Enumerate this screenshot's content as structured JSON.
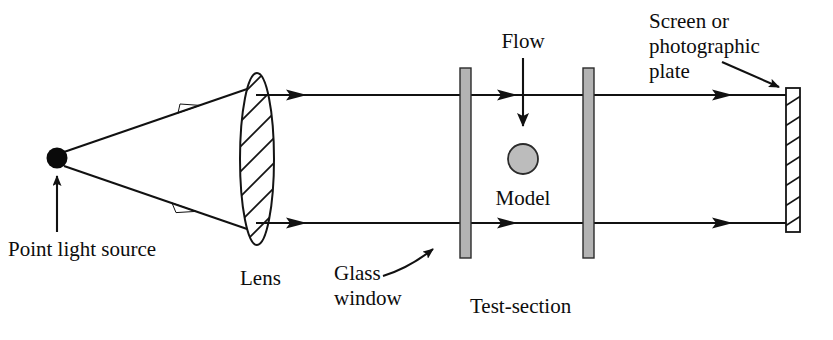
{
  "figure": {
    "background_color": "#ffffff",
    "ink_color": "#111111",
    "width": 833,
    "height": 340
  },
  "labels": {
    "point_light_source": "Point light source",
    "lens": "Lens",
    "glass_window_line1": "Glass",
    "glass_window_line2": "window",
    "test_section": "Test-section",
    "flow": "Flow",
    "model": "Model",
    "screen_line1": "Screen or",
    "screen_line2": "photographic",
    "screen_line3": "plate"
  },
  "components": {
    "point_source": {
      "name": "point-light-source",
      "shape": "filled-circle",
      "cx": 57,
      "cy": 158,
      "r": 10,
      "color": "#0a0a0a"
    },
    "lens": {
      "name": "lens",
      "shape": "hatched-ellipse",
      "cx": 257,
      "cy": 159,
      "rx": 17,
      "ry": 86,
      "hatch_direction": "diagonal-up-right",
      "hatch_count": 9,
      "fill": "#ffffff",
      "stroke": "#141414"
    },
    "glass_window_left": {
      "name": "glass-window-left",
      "shape": "rect",
      "x": 460,
      "y": 68,
      "width": 11,
      "height": 190,
      "fill": "#b3b3b3"
    },
    "glass_window_right": {
      "name": "glass-window-right",
      "shape": "rect",
      "x": 583,
      "y": 68,
      "width": 11,
      "height": 190,
      "fill": "#b3b3b3"
    },
    "model": {
      "name": "model",
      "shape": "circle",
      "cx": 523,
      "cy": 159,
      "r": 15,
      "fill": "#bcbcbc"
    },
    "screen": {
      "name": "screen-or-photographic-plate",
      "shape": "hatched-rect",
      "x": 786,
      "y": 88,
      "width": 14,
      "height": 144,
      "hatch_count": 7,
      "fill": "#ffffff"
    }
  },
  "rays": {
    "top_beam": {
      "name": "top-light-beam",
      "y": 95,
      "x_start": 257,
      "x_end": 790,
      "arrow_positions": [
        295,
        508,
        722
      ]
    },
    "bottom_beam": {
      "name": "bottom-light-beam",
      "y": 223,
      "x_start": 257,
      "x_end": 790,
      "arrow_positions": [
        295,
        508,
        722
      ]
    },
    "cone_upper": {
      "name": "divergent-ray-upper",
      "x1": 62,
      "y1": 152,
      "x2": 248,
      "y2": 88,
      "arrow_at": 0.62
    },
    "cone_lower": {
      "name": "divergent-ray-lower",
      "x1": 62,
      "y1": 166,
      "x2": 248,
      "y2": 230,
      "arrow_at": 0.62
    }
  },
  "annotations": {
    "flow_arrow": {
      "name": "flow-arrow",
      "x": 523,
      "y_start": 58,
      "y_end": 128,
      "direction": "down"
    },
    "source_arrow": {
      "name": "point-source-pointer",
      "x": 57,
      "y_start": 232,
      "y_end": 175,
      "direction": "up"
    },
    "glass_arrow": {
      "name": "glass-window-pointer",
      "from_x": 383,
      "from_y": 276,
      "to_x": 456,
      "to_y": 238,
      "style": "curved"
    },
    "screen_arrow": {
      "name": "screen-pointer",
      "from_x": 722,
      "from_y": 64,
      "to_x": 783,
      "to_y": 90,
      "style": "straight"
    }
  },
  "text_positions": {
    "point_light_source": {
      "x": 10,
      "y": 255
    },
    "lens": {
      "x": 240,
      "y": 283
    },
    "glass_window": {
      "x": 337,
      "y": 293
    },
    "test_section": {
      "x": 470,
      "y": 312
    },
    "flow": {
      "x": 523,
      "y": 48
    },
    "model": {
      "x": 523,
      "y": 203
    },
    "screen": {
      "x": 653,
      "y": 27
    }
  }
}
